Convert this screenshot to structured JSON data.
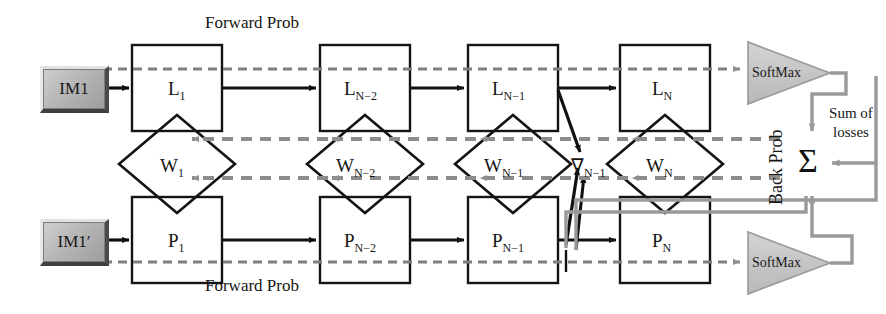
{
  "figure": {
    "colors": {
      "ink": "#151515",
      "forward_arrow": "#111111",
      "back_dashed": "#8c8c8c",
      "loss_gray": "#9a9a9a",
      "softmax_fill": "#c9c9c9",
      "im_box_fill": "#b6b6b6"
    }
  },
  "headers": {
    "top_forward": "Forward Prob",
    "bottom_forward": "Forward Prob",
    "back_prob": "Back Prob"
  },
  "inputs": [
    {
      "name": "input-top",
      "label": "IM1"
    },
    {
      "name": "input-bottom",
      "label": "IM1′"
    }
  ],
  "top_layers": [
    {
      "id": "L1",
      "base": "L",
      "sub": "1"
    },
    {
      "id": "LN2",
      "base": "L",
      "sub": "N−2"
    },
    {
      "id": "LN1",
      "base": "L",
      "sub": "N−1"
    },
    {
      "id": "LN",
      "base": "L",
      "sub": "N"
    }
  ],
  "weights": [
    {
      "id": "W1",
      "base": "W",
      "sub": "1"
    },
    {
      "id": "WN2",
      "base": "W",
      "sub": "N−2"
    },
    {
      "id": "WN1",
      "base": "W",
      "sub": "N−1"
    },
    {
      "id": "WN",
      "base": "W",
      "sub": "N"
    }
  ],
  "bottom_layers": [
    {
      "id": "P1",
      "base": "P",
      "sub": "1"
    },
    {
      "id": "PN2",
      "base": "P",
      "sub": "N−2"
    },
    {
      "id": "PN1",
      "base": "P",
      "sub": "N−1"
    },
    {
      "id": "PN",
      "base": "P",
      "sub": "N"
    }
  ],
  "gradient": {
    "id": "gradN1",
    "base": "∇",
    "sub": "N−1"
  },
  "softmax": [
    {
      "name": "softmax-top",
      "label": "SoftMax"
    },
    {
      "name": "softmax-bottom",
      "label": "SoftMax"
    }
  ],
  "loss": {
    "sigma": "Σ",
    "caption_line1": "Sum of",
    "caption_line2": "losses"
  }
}
